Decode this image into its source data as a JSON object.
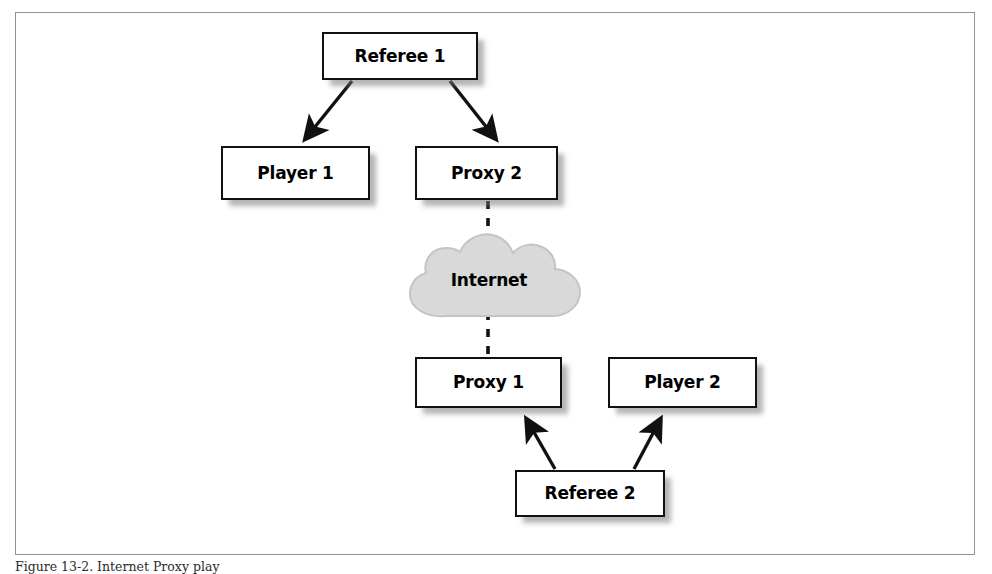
{
  "figure": {
    "caption": "Figure 13-2. Internet Proxy play",
    "frame_border_color": "#8e9195",
    "background_color": "#ffffff"
  },
  "diagram": {
    "type": "network-topology",
    "node_border_color": "#111111",
    "node_fill_color": "#ffffff",
    "shadow_color": "#787878",
    "cloud_fill_color": "#d9d9d9",
    "cloud_stroke_color": "#bdbdbd",
    "nodes": [
      {
        "id": "referee-1",
        "label": "Referee 1"
      },
      {
        "id": "player-1",
        "label": "Player 1"
      },
      {
        "id": "proxy-2",
        "label": "Proxy 2"
      },
      {
        "id": "cloud",
        "label": "Internet"
      },
      {
        "id": "proxy-1",
        "label": "Proxy 1"
      },
      {
        "id": "player-2",
        "label": "Player 2"
      },
      {
        "id": "referee-2",
        "label": "Referee 2"
      }
    ],
    "connections": [
      {
        "from": "referee-1",
        "to": "player-1",
        "style": "solid-arrow",
        "direction": "down-left"
      },
      {
        "from": "referee-1",
        "to": "proxy-2",
        "style": "solid-arrow",
        "direction": "down-right"
      },
      {
        "from": "proxy-2",
        "to": "cloud",
        "style": "dashed",
        "direction": "down"
      },
      {
        "from": "cloud",
        "to": "proxy-1",
        "style": "dashed",
        "direction": "down"
      },
      {
        "from": "referee-2",
        "to": "proxy-1",
        "style": "solid-arrow",
        "direction": "up-left"
      },
      {
        "from": "referee-2",
        "to": "player-2",
        "style": "solid-arrow",
        "direction": "up-right"
      }
    ]
  }
}
